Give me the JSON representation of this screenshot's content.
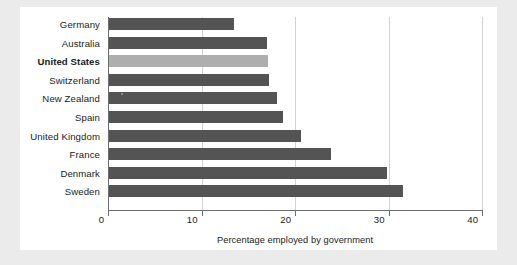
{
  "chart_data": {
    "type": "bar",
    "orientation": "horizontal",
    "title": "",
    "xlabel": "Percentage employed by government",
    "ylabel": "",
    "xlim": [
      0,
      40
    ],
    "xticks": [
      0,
      10,
      20,
      30,
      40
    ],
    "xtick_labels": [
      "0",
      "10",
      "20",
      "30",
      "40"
    ],
    "grid": "vertical gridlines at 10, 20, 30",
    "legend": "none",
    "categories": [
      "Germany",
      "Australia",
      "United States",
      "Switzerland",
      "New Zealand",
      "Spain",
      "United Kingdom",
      "France",
      "Denmark",
      "Sweden"
    ],
    "values": [
      13.4,
      16.9,
      17.0,
      17.1,
      18.0,
      18.6,
      20.5,
      23.7,
      29.7,
      31.4
    ],
    "highlight_category": "United States",
    "colors": {
      "bar": "#545454",
      "bar_highlight": "#aeaeae",
      "axis": "#6e6e6e",
      "gridline": "#d2d2d2",
      "text": "#1b1b1b",
      "panel_background": "#ffffff",
      "page_background": "#ebebeb"
    }
  },
  "axis": {
    "title": "Percentage employed by government",
    "ticks": [
      "0",
      "10",
      "20",
      "30",
      "40"
    ]
  },
  "rows": [
    {
      "label": "Germany",
      "value": 13.4,
      "bold": false,
      "highlight": false
    },
    {
      "label": "Australia",
      "value": 16.9,
      "bold": false,
      "highlight": false
    },
    {
      "label": "United States",
      "value": 17.0,
      "bold": true,
      "highlight": true
    },
    {
      "label": "Switzerland",
      "value": 17.1,
      "bold": false,
      "highlight": false
    },
    {
      "label": "New Zealand",
      "value": 18.0,
      "bold": false,
      "highlight": false
    },
    {
      "label": "Spain",
      "value": 18.6,
      "bold": false,
      "highlight": false
    },
    {
      "label": "United Kingdom",
      "value": 20.5,
      "bold": false,
      "highlight": false
    },
    {
      "label": "France",
      "value": 23.7,
      "bold": false,
      "highlight": false
    },
    {
      "label": "Denmark",
      "value": 29.7,
      "bold": false,
      "highlight": false
    },
    {
      "label": "Sweden",
      "value": 31.4,
      "bold": false,
      "highlight": false
    }
  ]
}
